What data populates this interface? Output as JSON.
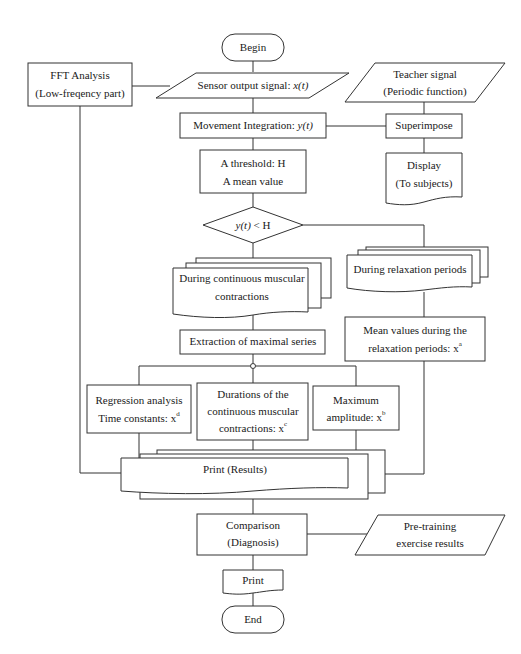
{
  "diagram": {
    "type": "flowchart",
    "colors": {
      "stroke": "#333333",
      "fill": "#ffffff",
      "text": "#1a1a1a",
      "background": "#ffffff"
    }
  },
  "nodes": {
    "begin": {
      "label": "Begin",
      "shape": "terminal"
    },
    "fft": {
      "line1": "FFT Analysis",
      "line2": "(Low-freqency part)",
      "shape": "process"
    },
    "sensor": {
      "prefix": "Sensor output signal: ",
      "var": "x(t)",
      "shape": "data"
    },
    "teacher": {
      "line1": "Teacher signal",
      "line2": "(Periodic function)",
      "shape": "data"
    },
    "movement": {
      "prefix": "Movement Integration: ",
      "var": "y(t)",
      "shape": "process"
    },
    "superimpose": {
      "label": "Superimpose",
      "shape": "process"
    },
    "threshold": {
      "line1": "A threshold: H",
      "line2": "A mean value",
      "shape": "process"
    },
    "display": {
      "line1": "Display",
      "line2": "(To subjects)",
      "shape": "document"
    },
    "decision": {
      "var": "y(t)",
      "suffix": " < H",
      "shape": "decision"
    },
    "contractions": {
      "line1": "During continuous muscular",
      "line2": "contractions",
      "shape": "multi-document"
    },
    "relaxation": {
      "label": "During relaxation periods",
      "shape": "multi-document"
    },
    "extraction": {
      "label": "Extraction of maximal series",
      "shape": "process"
    },
    "mean_values": {
      "line1": "Mean values during the",
      "line2": "relaxation periods: x",
      "sup": "a",
      "shape": "process"
    },
    "regression": {
      "line1": "Regression analysis",
      "line2": "Time constants: x",
      "sup": "d",
      "shape": "process"
    },
    "durations": {
      "line1": "Durations of the",
      "line2": "continuous muscular",
      "line3": "contractions: x",
      "sup": "c",
      "shape": "process"
    },
    "maximum": {
      "line1": "Maximum",
      "line2": "amplitude: x",
      "sup": "b",
      "shape": "process"
    },
    "print_results": {
      "label": "Print (Results)",
      "shape": "multi-document"
    },
    "comparison": {
      "line1": "Comparison",
      "line2": "(Diagnosis)",
      "shape": "process"
    },
    "pretraining": {
      "line1": "Pre-training",
      "line2": "exercise results",
      "shape": "data"
    },
    "print": {
      "label": "Print",
      "shape": "document"
    },
    "end": {
      "label": "End",
      "shape": "terminal"
    }
  },
  "edges": [
    [
      "begin",
      "sensor"
    ],
    [
      "sensor",
      "fft"
    ],
    [
      "sensor",
      "movement"
    ],
    [
      "teacher",
      "superimpose"
    ],
    [
      "movement",
      "superimpose"
    ],
    [
      "superimpose",
      "display"
    ],
    [
      "movement",
      "threshold"
    ],
    [
      "threshold",
      "decision"
    ],
    [
      "decision",
      "contractions"
    ],
    [
      "decision",
      "relaxation"
    ],
    [
      "contractions",
      "extraction"
    ],
    [
      "relaxation",
      "mean_values"
    ],
    [
      "extraction",
      "regression"
    ],
    [
      "extraction",
      "durations"
    ],
    [
      "extraction",
      "maximum"
    ],
    [
      "regression",
      "print_results"
    ],
    [
      "durations",
      "print_results"
    ],
    [
      "maximum",
      "print_results"
    ],
    [
      "fft",
      "print_results"
    ],
    [
      "mean_values",
      "print_results"
    ],
    [
      "print_results",
      "comparison"
    ],
    [
      "pretraining",
      "comparison"
    ],
    [
      "comparison",
      "print"
    ],
    [
      "print",
      "end"
    ]
  ]
}
